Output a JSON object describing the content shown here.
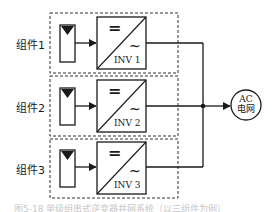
{
  "diagram": {
    "modules": [
      {
        "label": "组件1",
        "inverter": "INV 1",
        "dc_symbol": "=",
        "ac_symbol": "~"
      },
      {
        "label": "组件2",
        "inverter": "INV 2",
        "dc_symbol": "=",
        "ac_symbol": "~"
      },
      {
        "label": "组件3",
        "inverter": "INV 3",
        "dc_symbol": "=",
        "ac_symbol": "~"
      }
    ],
    "grid": {
      "line1": "AC",
      "line2": "电网"
    },
    "caption": "图5-18 单级组串式逆变器并网系统（以三组件为例）",
    "colors": {
      "stroke": "#1a1a1a",
      "dashed": "#333333",
      "background": "#ffffff"
    }
  }
}
